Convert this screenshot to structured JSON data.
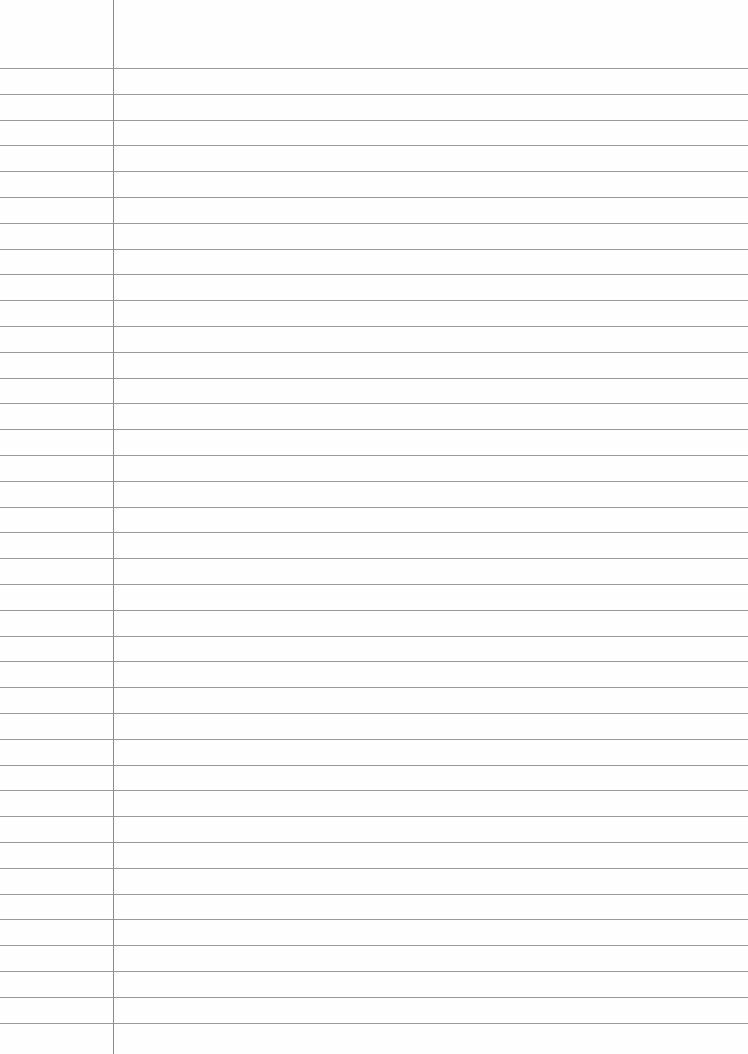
{
  "paper": {
    "type": "lined-paper",
    "margin_line_x": 113,
    "first_rule_y": 68,
    "rule_spacing": 25.8,
    "rule_count": 38,
    "rule_color": "#9a9a9a",
    "margin_color": "#8a8a8a",
    "background": "#fefefe"
  }
}
